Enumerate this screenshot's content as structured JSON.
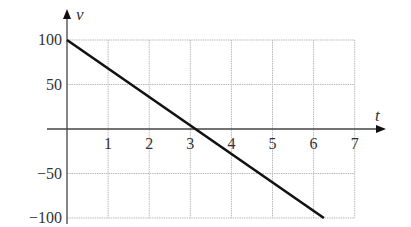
{
  "chart_data": {
    "type": "line",
    "title": "",
    "xlabel": "t",
    "ylabel": "v",
    "xlim": [
      0,
      7
    ],
    "ylim": [
      -100,
      100
    ],
    "x_ticks": [
      1,
      2,
      3,
      4,
      5,
      6,
      7
    ],
    "x_tick_labels": [
      "1",
      "2",
      "3",
      "4",
      "5",
      "6",
      "7"
    ],
    "y_ticks": [
      100,
      50,
      -50,
      -100
    ],
    "y_tick_labels": [
      "100",
      "50",
      "−50",
      "−100"
    ],
    "grid": true,
    "legend": null,
    "series": [
      {
        "name": "v(t)",
        "x": [
          0,
          3.125,
          6.25
        ],
        "y": [
          100,
          0,
          -100
        ]
      }
    ]
  },
  "colors": {
    "line": "#111111",
    "grid": "#bbbbbb",
    "axis": "#444444"
  }
}
